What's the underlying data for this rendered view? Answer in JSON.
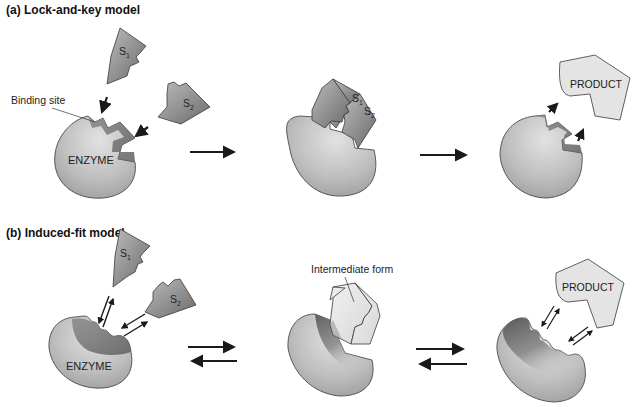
{
  "panel_a": {
    "title": "(a) Lock-and-key model",
    "binding_site_label": "Binding site",
    "enzyme_label": "ENZYME",
    "substrate1": {
      "letter": "S",
      "subscript": "1"
    },
    "substrate2": {
      "letter": "S",
      "subscript": "2"
    },
    "product_label": "PRODUCT"
  },
  "panel_b": {
    "title": "(b) Induced-fit model",
    "enzyme_label": "ENZYME",
    "substrate1": {
      "letter": "S",
      "subscript": "1"
    },
    "substrate2": {
      "letter": "S",
      "subscript": "2"
    },
    "intermediate_label": "Intermediate form",
    "product_label": "PRODUCT"
  },
  "colors": {
    "enzyme_light": "#d8d8d8",
    "enzyme_mid": "#a8a8a8",
    "enzyme_dark": "#6e6e6e",
    "substrate_light": "#b8b8b8",
    "substrate_dark": "#6a6a6a",
    "product_fill": "#e4e4e4",
    "outline": "#3a3a3a",
    "arrow": "#1a1a1a"
  }
}
